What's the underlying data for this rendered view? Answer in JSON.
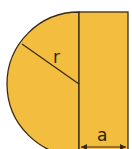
{
  "diagram": {
    "shape": "semicircle-plus-rectangle",
    "labels": {
      "radius": "r",
      "width": "a"
    },
    "colors": {
      "fill": "#f3bd3f",
      "stroke": "#3a2a12"
    }
  }
}
